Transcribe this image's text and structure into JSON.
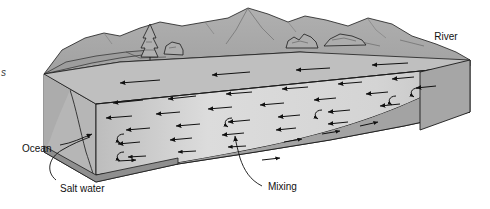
{
  "figure": {
    "type": "schematic-block-diagram",
    "background_color": "#ffffff"
  },
  "labels": {
    "river": "River",
    "ocean": "Ocean",
    "salt_water": "Salt water",
    "mixing": "Mixing",
    "cut_off_left": "s"
  },
  "palette": {
    "land_top": "#a8a8a8",
    "land_shadow": "#9a9a9a",
    "mountain": "#adadad",
    "mountain_dark": "#9c9c9c",
    "water_surface": "#d8d8d8",
    "water_surface_light": "#e4e4e4",
    "front_face": "#c9c9c9",
    "wedge_face": "#d2d2d2",
    "bottom_slab": "#9f9f9f",
    "bottom_slab_dark": "#8f8f8f",
    "side_face": "#b4b4b4",
    "outline": "#1a1a1a",
    "text": "#111111"
  },
  "elements": {
    "vegetation": [
      {
        "name": "conifer-tree",
        "x": 150,
        "y": 30
      },
      {
        "name": "bush-left",
        "x": 172,
        "y": 40
      },
      {
        "name": "bush-center",
        "x": 300,
        "y": 36
      },
      {
        "name": "bush-right",
        "x": 338,
        "y": 35
      }
    ],
    "flow_arrows": {
      "direction": "seaward-left",
      "count": 44,
      "curl_count": 6,
      "description": "Arrows in the estuary water body pointing left toward the ocean, with curling eddy arrows near the ocean end indicating mixing."
    }
  },
  "annotations": [
    {
      "label": "River",
      "points_to": "right-end-of-block",
      "leader": false
    },
    {
      "label": "Ocean",
      "points_to": "left-water-face",
      "leader": true
    },
    {
      "label": "Salt water",
      "points_to": "salt-wedge-bottom-left",
      "leader": true
    },
    {
      "label": "Mixing",
      "points_to": "mid-water-interface",
      "leader": true
    }
  ]
}
